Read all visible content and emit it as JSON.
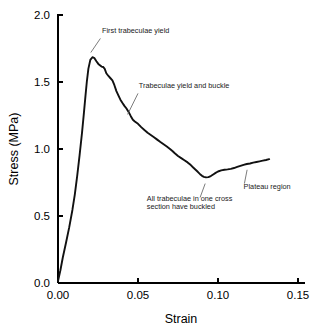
{
  "chart_data": {
    "type": "line",
    "title": "",
    "xlabel": "Strain",
    "ylabel": "Stress (MPa)",
    "xlim": [
      0.0,
      0.155
    ],
    "ylim": [
      0.0,
      2.0
    ],
    "grid": false,
    "legend": "none",
    "xticks": [
      0.0,
      0.05,
      0.1,
      0.15
    ],
    "xtick_labels": [
      "0.00",
      "0.05",
      "0.10",
      "0.15"
    ],
    "yticks": [
      0.0,
      0.5,
      1.0,
      1.5,
      2.0
    ],
    "ytick_labels": [
      "0.0",
      "0.5",
      "1.0",
      "1.5",
      "2.0"
    ],
    "series": [
      {
        "name": "trabecular bone stress-strain",
        "color": "#111111",
        "x": [
          0.0,
          0.0015,
          0.003,
          0.005,
          0.007,
          0.009,
          0.0105,
          0.012,
          0.0135,
          0.015,
          0.0162,
          0.0172,
          0.018,
          0.019,
          0.0202,
          0.0215,
          0.0228,
          0.024,
          0.0252,
          0.0262,
          0.0272,
          0.0282,
          0.0292,
          0.0302,
          0.0315,
          0.0328,
          0.034,
          0.0352,
          0.0365,
          0.0378,
          0.039,
          0.0402,
          0.0415,
          0.0428,
          0.0442,
          0.0455,
          0.0468,
          0.048,
          0.05,
          0.052,
          0.054,
          0.056,
          0.058,
          0.06,
          0.062,
          0.064,
          0.066,
          0.068,
          0.07,
          0.0715,
          0.073,
          0.075,
          0.077,
          0.079,
          0.081,
          0.083,
          0.0845,
          0.086,
          0.0875,
          0.0888,
          0.09,
          0.0912,
          0.0925,
          0.094,
          0.0955,
          0.097,
          0.0985,
          0.1,
          0.102,
          0.104,
          0.106,
          0.108,
          0.11,
          0.112,
          0.114,
          0.116,
          0.118,
          0.12,
          0.122,
          0.124,
          0.126,
          0.128,
          0.13,
          0.132
        ],
        "y": [
          0.015,
          0.095,
          0.19,
          0.3,
          0.415,
          0.545,
          0.66,
          0.8,
          0.955,
          1.12,
          1.27,
          1.4,
          1.5,
          1.6,
          1.665,
          1.685,
          1.678,
          1.655,
          1.635,
          1.625,
          1.615,
          1.612,
          1.598,
          1.565,
          1.545,
          1.528,
          1.512,
          1.478,
          1.432,
          1.398,
          1.368,
          1.345,
          1.322,
          1.302,
          1.275,
          1.245,
          1.218,
          1.205,
          1.188,
          1.163,
          1.142,
          1.122,
          1.105,
          1.088,
          1.07,
          1.052,
          1.035,
          1.018,
          1.0,
          0.985,
          0.968,
          0.948,
          0.932,
          0.916,
          0.9,
          0.88,
          0.862,
          0.845,
          0.828,
          0.812,
          0.8,
          0.792,
          0.788,
          0.79,
          0.798,
          0.81,
          0.822,
          0.832,
          0.84,
          0.845,
          0.848,
          0.852,
          0.858,
          0.866,
          0.874,
          0.882,
          0.888,
          0.892,
          0.898,
          0.903,
          0.908,
          0.913,
          0.918,
          0.924
        ]
      }
    ],
    "annotations": [
      {
        "id": "first-trabeculae-yield",
        "lines": [
          "First trabeculae yield"
        ],
        "text_x": 0.0275,
        "text_y": 1.865,
        "anchor": "start",
        "leader_from": [
          0.0265,
          1.825
        ],
        "leader_to": [
          0.0205,
          1.72
        ]
      },
      {
        "id": "trabeculae-yield-and-buckle",
        "lines": [
          "Trabeculae yield and buckle"
        ],
        "text_x": 0.0505,
        "text_y": 1.455,
        "anchor": "start",
        "leader_from": [
          0.05,
          1.415
        ],
        "leader_to": [
          0.0435,
          1.258
        ]
      },
      {
        "id": "all-trabeculae-buckled",
        "lines": [
          "All trabeculae in one cross",
          "section have buckled"
        ],
        "text_x": 0.0555,
        "text_y": 0.615,
        "anchor": "start",
        "leader_from": [
          0.092,
          0.742
        ],
        "leader_to": [
          0.0888,
          0.638
        ]
      },
      {
        "id": "plateau-region",
        "lines": [
          "Plateau region"
        ],
        "text_x": 0.116,
        "text_y": 0.7,
        "anchor": "start",
        "leader_from": [
          0.1182,
          0.845
        ],
        "leader_to": [
          0.1165,
          0.742
        ]
      }
    ]
  }
}
